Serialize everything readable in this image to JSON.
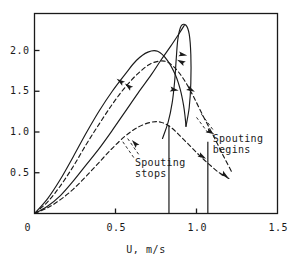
{
  "chart_data": {
    "type": "line",
    "title": "",
    "xlabel": "U, m/s",
    "ylabel": "",
    "xlim": [
      0.0,
      1.5
    ],
    "ylim": [
      0.0,
      2.35
    ],
    "grid": false,
    "legend": null,
    "xticks": [
      {
        "value": 0.0,
        "label": "0"
      },
      {
        "value": 0.5,
        "label": "0.5"
      },
      {
        "value": 1.0,
        "label": "1.0"
      },
      {
        "value": 1.5,
        "label": "1.5"
      }
    ],
    "yticks": [
      {
        "value": 0.5,
        "label": "0.5"
      },
      {
        "value": 1.0,
        "label": "1.0"
      },
      {
        "value": 1.5,
        "label": "1.5"
      },
      {
        "value": 2.0,
        "label": "2.0"
      }
    ],
    "annotations": [
      {
        "name": "spouting-stops",
        "text": "Spouting\nstops",
        "x": 0.62,
        "y": 0.62
      },
      {
        "name": "spouting-begins",
        "text": "Spouting\nbegins",
        "x": 1.1,
        "y": 0.92
      }
    ],
    "markers": [
      {
        "name": "vertical-drop-spouting-stops",
        "x": 0.83,
        "y_top": 1.08,
        "y_bottom": 0.0
      },
      {
        "name": "vertical-drop-spouting-begins",
        "x": 1.07,
        "y_top": 0.88,
        "y_bottom": 0.0
      }
    ],
    "series": [
      {
        "name": "upper-solid-ascending",
        "style": "solid",
        "arrow_direction": "up-right",
        "points": [
          [
            0.0,
            0.0
          ],
          [
            0.08,
            0.18
          ],
          [
            0.16,
            0.42
          ],
          [
            0.24,
            0.7
          ],
          [
            0.32,
            0.99
          ],
          [
            0.4,
            1.26
          ],
          [
            0.48,
            1.5
          ],
          [
            0.56,
            1.71
          ],
          [
            0.63,
            1.88
          ],
          [
            0.7,
            1.98
          ],
          [
            0.76,
            1.99
          ],
          [
            0.82,
            1.88
          ],
          [
            0.87,
            1.7
          ],
          [
            0.9,
            1.52
          ],
          [
            0.92,
            1.33
          ],
          [
            0.93,
            1.18
          ],
          [
            0.935,
            1.07
          ]
        ]
      },
      {
        "name": "upper-dashed-ascending",
        "style": "dashed",
        "arrow_direction": "up-right",
        "points": [
          [
            0.0,
            0.0
          ],
          [
            0.08,
            0.14
          ],
          [
            0.16,
            0.34
          ],
          [
            0.24,
            0.58
          ],
          [
            0.32,
            0.85
          ],
          [
            0.4,
            1.1
          ],
          [
            0.48,
            1.34
          ],
          [
            0.56,
            1.55
          ],
          [
            0.64,
            1.72
          ],
          [
            0.72,
            1.84
          ],
          [
            0.8,
            1.87
          ],
          [
            0.86,
            1.8
          ],
          [
            0.92,
            1.65
          ],
          [
            0.98,
            1.44
          ],
          [
            1.04,
            1.2
          ],
          [
            1.1,
            0.97
          ],
          [
            1.16,
            0.73
          ],
          [
            1.22,
            0.5
          ]
        ]
      },
      {
        "name": "loop-solid-descending",
        "style": "solid",
        "arrow_direction": "down-left",
        "points": [
          [
            0.935,
            1.07
          ],
          [
            0.955,
            1.3
          ],
          [
            0.965,
            1.6
          ],
          [
            0.965,
            1.95
          ],
          [
            0.955,
            2.2
          ],
          [
            0.935,
            2.31
          ],
          [
            0.905,
            2.3
          ],
          [
            0.885,
            2.14
          ],
          [
            0.875,
            1.9
          ],
          [
            0.865,
            1.62
          ],
          [
            0.85,
            1.36
          ],
          [
            0.825,
            1.12
          ],
          [
            0.79,
            0.92
          ]
        ]
      },
      {
        "name": "lower-solid-ascending",
        "style": "solid",
        "arrow_direction": "up-right",
        "points": [
          [
            0.0,
            0.0
          ],
          [
            0.08,
            0.09
          ],
          [
            0.16,
            0.22
          ],
          [
            0.24,
            0.4
          ],
          [
            0.32,
            0.6
          ],
          [
            0.4,
            0.8
          ],
          [
            0.48,
            1.02
          ],
          [
            0.56,
            1.25
          ],
          [
            0.64,
            1.48
          ],
          [
            0.72,
            1.7
          ],
          [
            0.78,
            1.88
          ],
          [
            0.84,
            2.05
          ],
          [
            0.89,
            2.2
          ],
          [
            0.925,
            2.31
          ]
        ]
      },
      {
        "name": "lower-dashed-descending",
        "style": "dashed",
        "arrow_direction": "down-right",
        "points": [
          [
            0.0,
            0.0
          ],
          [
            0.08,
            0.07
          ],
          [
            0.16,
            0.17
          ],
          [
            0.24,
            0.3
          ],
          [
            0.32,
            0.46
          ],
          [
            0.4,
            0.63
          ],
          [
            0.48,
            0.8
          ],
          [
            0.56,
            0.95
          ],
          [
            0.64,
            1.06
          ],
          [
            0.72,
            1.12
          ],
          [
            0.78,
            1.12
          ],
          [
            0.84,
            1.06
          ],
          [
            0.9,
            0.95
          ],
          [
            0.96,
            0.83
          ],
          [
            1.02,
            0.71
          ],
          [
            1.08,
            0.6
          ],
          [
            1.14,
            0.5
          ],
          [
            1.2,
            0.43
          ]
        ]
      }
    ],
    "arrows": [
      {
        "name": "arrow-upper-solid-ascend",
        "x": 0.53,
        "y": 1.62,
        "angle": -55
      },
      {
        "name": "arrow-upper-dashed-ascend",
        "x": 0.58,
        "y": 1.56,
        "angle": -52
      },
      {
        "name": "arrow-loop-top-descend",
        "x": 0.915,
        "y": 1.95,
        "angle": 100
      },
      {
        "name": "arrow-loop-mid-descend",
        "x": 0.862,
        "y": 1.52,
        "angle": 100
      },
      {
        "name": "arrow-lower-solid-ascend",
        "x": 0.905,
        "y": 1.86,
        "angle": -62
      },
      {
        "name": "arrow-upper-dashed-descend",
        "x": 0.965,
        "y": 1.52,
        "angle": 118
      },
      {
        "name": "arrow-upper-dashed-tail",
        "x": 1.085,
        "y": 1.0,
        "angle": 118
      },
      {
        "name": "arrow-lower-dashed-descend",
        "x": 1.035,
        "y": 0.7,
        "angle": 120
      },
      {
        "name": "arrow-lower-dashed-tail",
        "x": 1.175,
        "y": 0.47,
        "angle": 126
      },
      {
        "name": "arrow-lower-dashed-mid",
        "x": 0.62,
        "y": 0.86,
        "angle": -42
      }
    ],
    "colors": {
      "axis": "#1a1a1a",
      "curve": "#1a1a1a",
      "background": "#ffffff"
    }
  }
}
